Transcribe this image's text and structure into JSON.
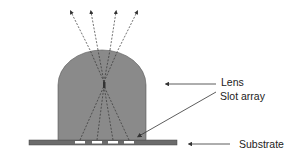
{
  "diagram": {
    "type": "cross-section schematic",
    "labels": {
      "lens": "Lens",
      "slot_array": "Slot array",
      "substrate": "Substrate"
    },
    "components": [
      {
        "name": "Lens",
        "shape": "dome (rectangle with semicircular top)",
        "fill": "#8a8a8a"
      },
      {
        "name": "Slot array",
        "count": 4,
        "fill": "#ffffff"
      },
      {
        "name": "Substrate",
        "shape": "flat bar",
        "fill": "#6e6e6e"
      }
    ],
    "rays": {
      "count": 4,
      "style": "dashed",
      "description": "rays from slots converge to a focal point inside the lens then diverge upward out of the dome"
    },
    "colors": {
      "lens_fill": "#8a8a8a",
      "substrate_fill": "#6b6b6b",
      "slot_fill": "#ffffff",
      "line": "#333333",
      "background": "#ffffff"
    }
  }
}
